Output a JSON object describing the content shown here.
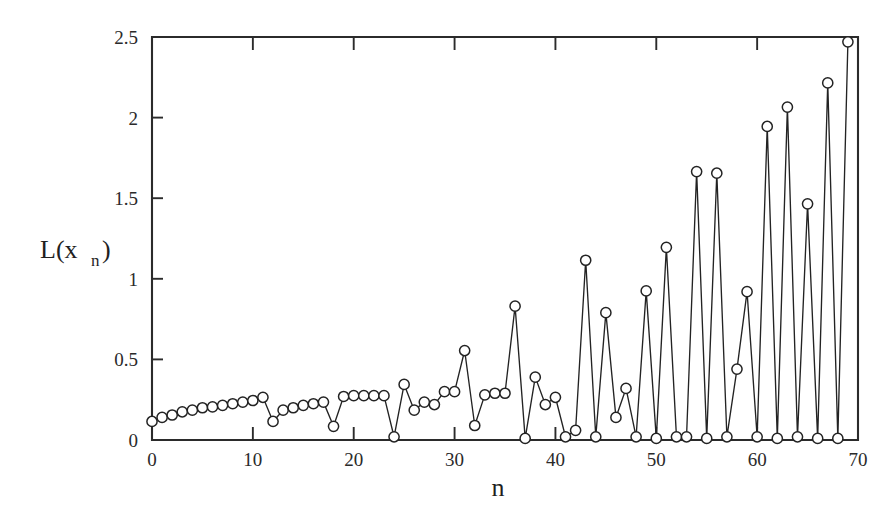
{
  "figure": {
    "name": "lyapunov-exponent-series-plot",
    "background_color": "#ffffff",
    "ink_color": "#232323"
  },
  "chart_data": {
    "type": "line",
    "title": "",
    "subtitle": "",
    "xlabel": "n",
    "ylabel": "L(x",
    "ylabel_subscript": "n",
    "ylabel_suffix": ")",
    "xlim": [
      0,
      70
    ],
    "ylim": [
      0,
      2.5
    ],
    "xticks": [
      0,
      10,
      20,
      30,
      40,
      50,
      60,
      70
    ],
    "xticklabels": [
      "0",
      "10",
      "20",
      "30",
      "40",
      "50",
      "60",
      "70"
    ],
    "yticks": [
      0,
      0.5,
      1,
      1.5,
      2,
      2.5
    ],
    "yticklabels": [
      "0",
      "0.5",
      "1",
      "1.5",
      "2",
      "2.5"
    ],
    "grid": false,
    "legend": null,
    "marker": "open-circle",
    "marker_size": 7,
    "line_style": "solid",
    "x": [
      0,
      1,
      2,
      3,
      4,
      5,
      6,
      7,
      8,
      9,
      10,
      11,
      12,
      13,
      14,
      15,
      16,
      17,
      18,
      19,
      20,
      21,
      22,
      23,
      24,
      25,
      26,
      27,
      28,
      29,
      30,
      31,
      32,
      33,
      34,
      35,
      36,
      37,
      38,
      39,
      40,
      41,
      42,
      43,
      44,
      45,
      46,
      47,
      48,
      49,
      50,
      51,
      52,
      53,
      54,
      55,
      56,
      57,
      58,
      59,
      60,
      61,
      62,
      63,
      64,
      65,
      66,
      67,
      68,
      69
    ],
    "values": [
      0.115,
      0.14,
      0.155,
      0.175,
      0.185,
      0.2,
      0.205,
      0.215,
      0.225,
      0.235,
      0.245,
      0.265,
      0.115,
      0.185,
      0.2,
      0.215,
      0.225,
      0.235,
      0.085,
      0.27,
      0.275,
      0.275,
      0.275,
      0.275,
      0.02,
      0.345,
      0.185,
      0.235,
      0.22,
      0.3,
      0.3,
      0.555,
      0.09,
      0.28,
      0.29,
      0.29,
      0.83,
      0.01,
      0.39,
      0.22,
      0.265,
      0.02,
      0.06,
      1.115,
      0.02,
      0.79,
      0.14,
      0.32,
      0.02,
      0.925,
      0.01,
      1.195,
      0.02,
      0.02,
      1.665,
      0.01,
      1.655,
      0.02,
      0.44,
      0.92,
      0.02,
      1.945,
      0.01,
      2.065,
      0.02,
      1.465,
      0.01,
      2.215,
      0.01,
      2.47
    ]
  },
  "axis_titles": {
    "y_main": "L(x",
    "y_sub": "n",
    "y_close": ")",
    "x": "n"
  }
}
